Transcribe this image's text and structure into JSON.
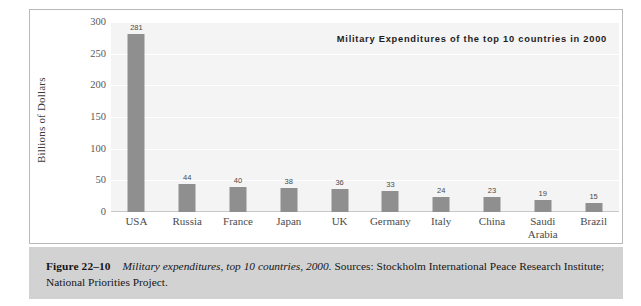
{
  "figure": {
    "caption_figure_number": "Figure 22–10",
    "caption_italic_title": "Military expenditures, top 10 countries, 2000.",
    "caption_sources": "Sources: Stockholm International Peace Research Institute; National Priorities Project."
  },
  "colors": {
    "bar_fill": "#8f8f8f",
    "plot_background": "#f4f4f4",
    "gridline": "#ffffff",
    "caption_band": "#d2d2d2",
    "frame_border": "#b9b9b9",
    "page_background": "#ffffff",
    "axis_text": "#585858",
    "title_text": "#1d1d1d"
  },
  "chart_data": {
    "type": "bar",
    "title": "Military Expenditures of the top 10 countries in 2000",
    "xlabel": "",
    "ylabel": "Billions of Dollars",
    "ylim": [
      0,
      300
    ],
    "yticks": [
      0,
      50,
      100,
      150,
      200,
      250,
      300
    ],
    "ytick_labels": [
      "0",
      "50",
      "100",
      "150",
      "200",
      "250",
      "300"
    ],
    "grid": true,
    "grid_axis": "y",
    "legend": false,
    "legend_position": "none",
    "value_labels": true,
    "units": "Billions of Dollars",
    "categories": [
      "USA",
      "Russia",
      "France",
      "Japan",
      "UK",
      "Germany",
      "Italy",
      "China",
      "Saudi Arabia",
      "Brazil"
    ],
    "values": [
      281,
      44,
      40,
      38,
      36,
      33,
      24,
      23,
      19,
      15
    ],
    "value_label_text": [
      "281",
      "44",
      "40",
      "38",
      "36",
      "33",
      "24",
      "23",
      "19",
      "15"
    ]
  }
}
